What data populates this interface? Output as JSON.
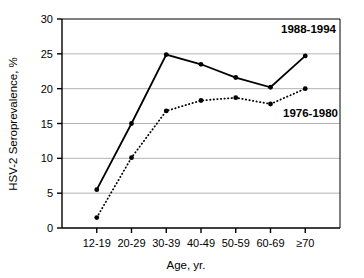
{
  "chart_data": {
    "type": "line",
    "title": "",
    "xlabel": "Age, yr.",
    "ylabel": "HSV-2 Seroprevalence, %",
    "categories": [
      "12-19",
      "20-29",
      "30-39",
      "40-49",
      "50-59",
      "60-69",
      "≥70"
    ],
    "ylim": [
      0,
      30
    ],
    "yticks": [
      0,
      5,
      10,
      15,
      20,
      25,
      30
    ],
    "ytick_labels": [
      "0",
      "5",
      "10",
      "15",
      "20",
      "25",
      "30"
    ],
    "grid": "horizontal",
    "legend_position": "inline-annotations",
    "series": [
      {
        "name": "1988-1994",
        "style": "solid",
        "marker": "filled-circle",
        "color": "#000000",
        "values": [
          5.5,
          15.0,
          24.9,
          23.5,
          21.6,
          20.2,
          24.7
        ],
        "annotation": {
          "text": "1988-1994",
          "x_category": "≥70",
          "y_value": 28.0
        }
      },
      {
        "name": "1976-1980",
        "style": "dotted",
        "marker": "filled-circle",
        "color": "#000000",
        "values": [
          1.5,
          10.1,
          16.8,
          18.3,
          18.7,
          17.8,
          20.0
        ],
        "annotation": {
          "text": "1976-1980",
          "x_category": "60-69",
          "y_value": 16.0
        }
      }
    ]
  },
  "annotations": {
    "series_1_label": "1988-1994",
    "series_2_label": "1976-1980"
  },
  "axes": {
    "y_title": "HSV-2 Seroprevalence, %",
    "x_title": "Age, yr.",
    "y_tick_0": "0",
    "y_tick_1": "5",
    "y_tick_2": "10",
    "y_tick_3": "15",
    "y_tick_4": "20",
    "y_tick_5": "25",
    "y_tick_6": "30",
    "x_tick_0": "12-19",
    "x_tick_1": "20-29",
    "x_tick_2": "30-39",
    "x_tick_3": "40-49",
    "x_tick_4": "50-59",
    "x_tick_5": "60-69",
    "x_tick_6": "≥70"
  }
}
